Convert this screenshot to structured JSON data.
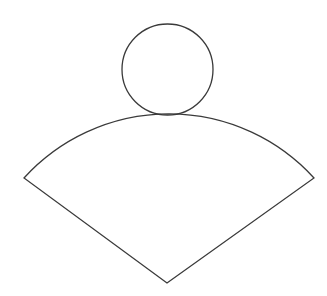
{
  "diagram": {
    "top_text_cutoff": "",
    "stroke_color": "#3a3a3a",
    "background": "#ffffff",
    "shapes": {
      "circle": {
        "cx": 167.5,
        "cy": 69.5,
        "r": 45.5
      },
      "sector": {
        "apex": [
          167,
          283
        ],
        "left_corner": [
          24,
          178
        ],
        "right_corner": [
          314,
          178
        ],
        "arc_top_y": 114,
        "arc_radius": 196
      }
    }
  }
}
